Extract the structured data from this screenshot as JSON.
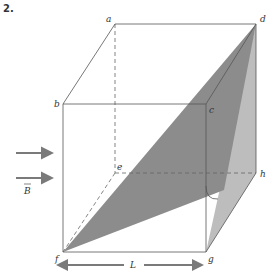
{
  "problem_number": "2.",
  "vertices": {
    "a": "a",
    "b": "b",
    "c": "c",
    "d": "d",
    "e": "e",
    "f": "f",
    "g": "g",
    "h": "h"
  },
  "field_label": "B",
  "length_label": "L",
  "colors": {
    "edge": "#555555",
    "dark_plane": "#8c8c8c",
    "light_plane": "#bdbdbd",
    "arrow": "#7a7a7a"
  }
}
